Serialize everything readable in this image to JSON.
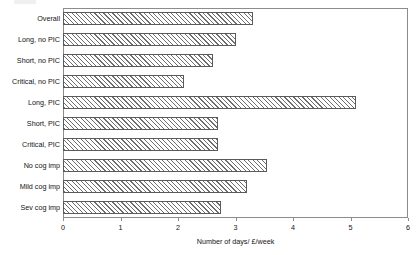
{
  "chart_data": {
    "type": "bar",
    "orientation": "horizontal",
    "title": "",
    "xlabel": "Number of days/ £/week",
    "ylabel": "",
    "xlim": [
      0,
      6
    ],
    "xticks": [
      0,
      1,
      2,
      3,
      4,
      5,
      6
    ],
    "xtick_labels": [
      "0",
      "1",
      "2",
      "3",
      "4",
      "5",
      "6"
    ],
    "grid": false,
    "legend": false,
    "bar_style": "diagonal-hatch",
    "categories": [
      "Overall",
      "Long, no PIC",
      "Short, no PIC",
      "Critical, no PIC",
      "Long, PIC",
      "Short, PIC",
      "Critical, PIC",
      "No cog imp",
      "Mild cog imp",
      "Sev cog imp"
    ],
    "values": [
      3.3,
      3.0,
      2.6,
      2.1,
      5.1,
      2.7,
      2.7,
      3.55,
      3.2,
      2.75
    ]
  },
  "colors": {
    "axis": "#8c8c8c",
    "bar_outline": "#5a5a5a",
    "hatch": "#6e6e6e",
    "background": "#ffffff",
    "text": "#141414"
  }
}
